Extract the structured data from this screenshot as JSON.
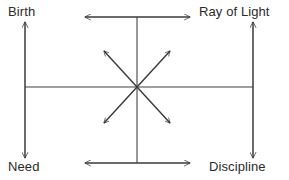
{
  "diagram": {
    "type": "cross-axis-arrow-diagram",
    "background_color": "#ffffff",
    "line_color": "#7f7f7f",
    "arrow_color": "#3a3a3a",
    "text_color": "#2b2b2b",
    "labels": {
      "top_left": "Birth",
      "top_right": "Ray of Light",
      "bottom_left": "Need",
      "bottom_right": "Discipline"
    },
    "axes": [
      {
        "name": "left-vertical-axis",
        "orientation": "vertical",
        "arrowheads": "both",
        "from_label": "Birth",
        "to_label": "Need"
      },
      {
        "name": "right-vertical-axis",
        "orientation": "vertical",
        "arrowheads": "both",
        "from_label": "Ray of Light",
        "to_label": "Discipline"
      },
      {
        "name": "top-horizontal-axis",
        "orientation": "horizontal",
        "arrowheads": "both",
        "from_label": "Birth",
        "to_label": "Ray of Light"
      },
      {
        "name": "bottom-horizontal-axis",
        "orientation": "horizontal",
        "arrowheads": "both",
        "from_label": "Need",
        "to_label": "Discipline"
      }
    ],
    "connectors": [
      {
        "name": "center-horizontal-line",
        "orientation": "horizontal",
        "arrowheads": "none"
      },
      {
        "name": "center-vertical-line",
        "orientation": "vertical",
        "arrowheads": "none"
      }
    ],
    "radiating_arrows": {
      "count": 4,
      "origin": "center",
      "directions": [
        "up-left",
        "up-right",
        "down-left",
        "down-right"
      ],
      "arrowheads": "outward"
    }
  }
}
